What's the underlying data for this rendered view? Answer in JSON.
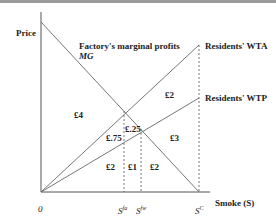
{
  "diagram": {
    "y_axis_label": "Price",
    "x_axis_label": "Smoke (S)",
    "origin_label": "0",
    "curves": {
      "mg": {
        "label": "Factory's marginal profits",
        "short": "MG"
      },
      "wta": {
        "label": "Residents' WTA"
      },
      "wtp": {
        "label": "Residents' WTP"
      }
    },
    "x_ticks": [
      {
        "base": "S",
        "sup": "fa"
      },
      {
        "base": "S",
        "sup": "fw"
      },
      {
        "base": "S",
        "sup": "C"
      }
    ],
    "areas": [
      {
        "id": "area-4",
        "label": "£4"
      },
      {
        "id": "area-2-top",
        "label": "£2"
      },
      {
        "id": "area-075",
        "label": "£.75"
      },
      {
        "id": "area-025",
        "label": "£.25"
      },
      {
        "id": "area-3",
        "label": "£3"
      },
      {
        "id": "area-2-left",
        "label": "£2"
      },
      {
        "id": "area-1",
        "label": "£1"
      },
      {
        "id": "area-2-right",
        "label": "£2"
      }
    ]
  },
  "colors": {
    "line": "#555555",
    "text": "#222222",
    "topbar": "#9a9a9a"
  }
}
